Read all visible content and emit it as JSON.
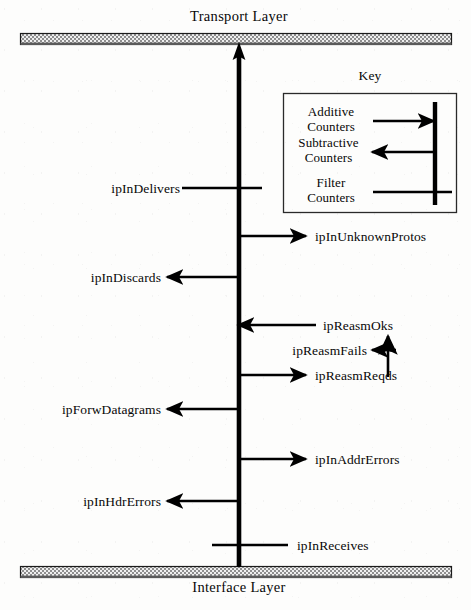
{
  "diagram": {
    "title_top": "Transport Layer",
    "title_bottom": "Interface Layer",
    "trunk": {
      "name": "ip-datagram-flow-trunk",
      "direction": "upward"
    },
    "key": {
      "title": "Key",
      "entries": [
        {
          "id": "additive",
          "line1": "Additive",
          "line2": "Counters",
          "arrow": "into-trunk"
        },
        {
          "id": "subtractive",
          "line1": "Subtractive",
          "line2": "Counters",
          "arrow": "out-of-trunk"
        },
        {
          "id": "filter",
          "line1": "Filter",
          "line2": "Counters",
          "arrow": "crosses-trunk"
        }
      ]
    },
    "counters": [
      {
        "id": "ipInDelivers",
        "label": "ipInDelivers",
        "side": "left",
        "kind": "filter",
        "y": 188
      },
      {
        "id": "ipInUnknownProtos",
        "label": "ipInUnknownProtos",
        "side": "right",
        "kind": "subtractive",
        "y": 236
      },
      {
        "id": "ipInDiscards",
        "label": "ipInDiscards",
        "side": "left",
        "kind": "subtractive",
        "y": 277
      },
      {
        "id": "ipReasmOks",
        "label": "ipReasmOks",
        "side": "right",
        "kind": "additive",
        "y": 325
      },
      {
        "id": "ipReasmFails",
        "label": "ipReasmFails",
        "side": "right",
        "kind": "subtractive",
        "y": 350
      },
      {
        "id": "ipReasmReqds",
        "label": "ipReasmReqds",
        "side": "right",
        "kind": "subtractive",
        "y": 375
      },
      {
        "id": "ipForwDatagrams",
        "label": "ipForwDatagrams",
        "side": "left",
        "kind": "subtractive",
        "y": 409
      },
      {
        "id": "ipInAddrErrors",
        "label": "ipInAddrErrors",
        "side": "right",
        "kind": "subtractive",
        "y": 459
      },
      {
        "id": "ipInHdrErrors",
        "label": "ipInHdrErrors",
        "side": "left",
        "kind": "subtractive",
        "y": 501
      },
      {
        "id": "ipInReceives",
        "label": "ipInReceives",
        "side": "right",
        "kind": "filter",
        "y": 545
      }
    ],
    "colors": {
      "ink": "#000000",
      "bar_fill": "#c9c9c9",
      "bar_edge": "#1a1a1a",
      "background": "#fdfdfc"
    }
  }
}
